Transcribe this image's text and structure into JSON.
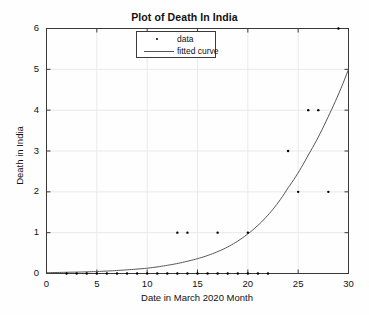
{
  "chart_data": {
    "type": "scatter",
    "title": "Plot of Death In India",
    "xlabel": "Date in March 2020 Month",
    "ylabel": "Death in India",
    "xlim": [
      0,
      30
    ],
    "ylim": [
      0,
      6
    ],
    "xticks": [
      0,
      5,
      10,
      15,
      20,
      25,
      30
    ],
    "yticks": [
      0,
      1,
      2,
      3,
      4,
      5,
      6
    ],
    "grid": true,
    "legend_position": "top-center",
    "series": [
      {
        "name": "data",
        "type": "scatter",
        "marker": "dot",
        "color": "#000000",
        "points": [
          [
            2,
            0
          ],
          [
            3,
            0
          ],
          [
            4,
            0
          ],
          [
            5,
            0
          ],
          [
            6,
            0
          ],
          [
            7,
            0
          ],
          [
            8,
            0
          ],
          [
            9,
            0
          ],
          [
            10,
            0
          ],
          [
            11,
            0
          ],
          [
            12,
            0
          ],
          [
            13,
            0
          ],
          [
            14,
            0
          ],
          [
            15,
            0
          ],
          [
            16,
            0
          ],
          [
            17,
            0
          ],
          [
            18,
            0
          ],
          [
            19,
            0
          ],
          [
            20,
            0
          ],
          [
            21,
            0
          ],
          [
            22,
            0
          ],
          [
            13,
            1
          ],
          [
            14,
            1
          ],
          [
            17,
            1
          ],
          [
            20,
            1
          ],
          [
            24,
            3
          ],
          [
            25,
            2
          ],
          [
            26,
            4
          ],
          [
            27,
            4
          ],
          [
            28,
            2
          ],
          [
            29,
            6
          ]
        ]
      },
      {
        "name": "fitted curve",
        "type": "line",
        "color": "#555555",
        "description": "exponential fit rising from 0 at x=0 to 5 at x=30",
        "x": [
          0,
          2,
          4,
          6,
          8,
          10,
          12,
          14,
          16,
          18,
          20,
          22,
          24,
          26,
          28,
          30
        ],
        "y": [
          0.02,
          0.03,
          0.04,
          0.06,
          0.09,
          0.13,
          0.2,
          0.3,
          0.44,
          0.65,
          0.97,
          1.43,
          2.1,
          2.9,
          3.85,
          5.0
        ]
      }
    ]
  },
  "legend": {
    "items": [
      {
        "label": "data",
        "symbol": "dot-marker"
      },
      {
        "label": "fitted curve",
        "symbol": "line-marker"
      }
    ]
  },
  "colors": {
    "axis": "#3a3a3a",
    "grid": "#e9e9e9",
    "marker": "#000000",
    "curve": "#555555",
    "background": "#fefefe"
  }
}
